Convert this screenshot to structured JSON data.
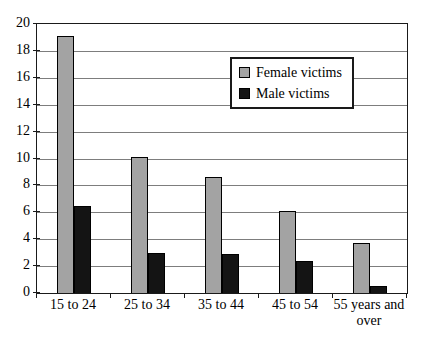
{
  "chart_data": {
    "type": "bar",
    "title": "",
    "xlabel": "",
    "ylabel": "",
    "categories": [
      "15 to 24",
      "25 to 34",
      "35 to 44",
      "45 to 54",
      "55 years and\nover"
    ],
    "series": [
      {
        "name": "Female victims",
        "color": "#a3a3a3",
        "values": [
          19.1,
          10.1,
          8.6,
          6.1,
          3.7
        ]
      },
      {
        "name": "Male victims",
        "color": "#141414",
        "values": [
          6.5,
          3.0,
          2.9,
          2.4,
          0.5
        ]
      }
    ],
    "ylim": [
      0,
      20
    ],
    "ytick_step": 2,
    "ytick_labels": [
      "0",
      "2",
      "4",
      "6",
      "8",
      "10",
      "12",
      "14",
      "16",
      "18",
      "20"
    ],
    "grid": "horizontal",
    "legend_position": "upper-center-right",
    "plot_border_color": "#1a1a1a",
    "gridline_color": "#7d7d7d",
    "background_color": "#ffffff"
  }
}
